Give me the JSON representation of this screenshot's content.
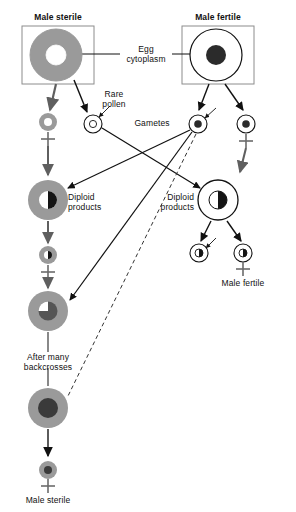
{
  "figure": {
    "title_visible": false,
    "background": "#ffffff",
    "colors": {
      "cytoplasm_sterile": "#9a9a9a",
      "cytoplasm_fertile": "#ffffff",
      "nucleus_dark": "#2b2b2b",
      "nucleus_gray": "#6d6d6d",
      "line": "#111111",
      "box_border": "#8c8c8c",
      "arrow_gray": "#6b6b6b"
    }
  },
  "labels": {
    "male_sterile_top": "Male sterile",
    "male_fertile_top": "Male fertile",
    "egg_cytoplasm": "Egg\ncytoplasm",
    "rare_pollen": "Rare\npollen",
    "gametes": "Gametes",
    "diploid_products_left": "Diploid\nproducts",
    "diploid_products_right": "Diploid\nproducts",
    "male_fertile_bottom": "Male fertile",
    "after_many_backcrosses": "After many\nbackcrosses",
    "male_sterile_bottom": "Male sterile",
    "plus_sign": "+"
  },
  "cells": [
    {
      "name": "male-sterile-parent",
      "role": "parent cell, male sterile, gray (sterile) cytoplasm, white nucleus",
      "cx": 56,
      "cy": 55,
      "r": 26,
      "cytoplasm": "#9a9a9a",
      "nucleus": "#ffffff",
      "nucleus_r": 10,
      "nucleus_style": "solid"
    },
    {
      "name": "male-fertile-parent",
      "role": "parent cell, male fertile, white (normal) cytoplasm, dark nucleus",
      "cx": 216,
      "cy": 55,
      "r": 26,
      "cytoplasm": "#ffffff",
      "nucleus": "#2b2b2b",
      "nucleus_r": 10,
      "nucleus_style": "solid"
    },
    {
      "name": "gamete-sterile-egg",
      "role": "egg gamete from male sterile parent",
      "cx": 48,
      "cy": 122,
      "r": 9,
      "cytoplasm": "#9a9a9a",
      "nucleus": "#ffffff",
      "nucleus_r": 4,
      "nucleus_style": "solid"
    },
    {
      "name": "gamete-rare-pollen",
      "role": "rare pollen from male sterile parent",
      "cx": 93,
      "cy": 124,
      "r": 9,
      "cytoplasm": "#ffffff",
      "nucleus": "#ffffff",
      "nucleus_r": 4,
      "nucleus_style": "outline"
    },
    {
      "name": "gamete-fertile-pollen",
      "role": "pollen gamete from male fertile parent",
      "cx": 198,
      "cy": 124,
      "r": 9,
      "cytoplasm": "#ffffff",
      "nucleus": "#2b2b2b",
      "nucleus_r": 4,
      "nucleus_style": "solid"
    },
    {
      "name": "gamete-fertile-egg",
      "role": "egg gamete from male fertile parent",
      "cx": 246,
      "cy": 124,
      "r": 9,
      "cytoplasm": "#ffffff",
      "nucleus": "#2b2b2b",
      "nucleus_r": 4,
      "nucleus_style": "solid"
    },
    {
      "name": "diploid-left",
      "role": "diploid product, sterile cytoplasm, hybrid nucleus",
      "cx": 48,
      "cy": 200,
      "r": 20,
      "cytoplasm": "#9a9a9a",
      "nucleus": "split",
      "nucleus_r": 9,
      "nucleus_style": "split"
    },
    {
      "name": "diploid-right",
      "role": "diploid product, normal cytoplasm, hybrid nucleus",
      "cx": 218,
      "cy": 200,
      "r": 20,
      "cytoplasm": "#ffffff",
      "nucleus": "split",
      "nucleus_r": 9,
      "nucleus_style": "split"
    },
    {
      "name": "gamete-backcross-1",
      "role": "gamete from left diploid product, sterile cytoplasm, hybrid nucleus",
      "cx": 48,
      "cy": 255,
      "r": 9,
      "cytoplasm": "#9a9a9a",
      "nucleus": "split",
      "nucleus_r": 4,
      "nucleus_style": "split"
    },
    {
      "name": "backcross-cell",
      "role": "backcross progeny cell, sterile cytoplasm, mostly recurrent nucleus",
      "cx": 48,
      "cy": 311,
      "r": 20,
      "cytoplasm": "#9a9a9a",
      "nucleus": "#555555",
      "nucleus_r": 9,
      "nucleus_style": "notch"
    },
    {
      "name": "male-sterile-line-cell",
      "role": "resulting male sterile line cell after many backcrosses",
      "cx": 48,
      "cy": 408,
      "r": 20,
      "cytoplasm": "#9a9a9a",
      "nucleus": "#3a3a3a",
      "nucleus_r": 9,
      "nucleus_style": "solid"
    },
    {
      "name": "male-sterile-final-gamete",
      "role": "final male sterile gamete",
      "cx": 48,
      "cy": 470,
      "r": 9,
      "cytoplasm": "#9a9a9a",
      "nucleus": "#3a3a3a",
      "nucleus_r": 4,
      "nucleus_style": "solid"
    },
    {
      "name": "gamete-fertile-out-left",
      "role": "gamete from right diploid product",
      "cx": 199,
      "cy": 253,
      "r": 9,
      "cytoplasm": "#ffffff",
      "nucleus": "split",
      "nucleus_r": 4,
      "nucleus_style": "split"
    },
    {
      "name": "gamete-fertile-out-right",
      "role": "gamete from right diploid product, male fertile",
      "cx": 243,
      "cy": 253,
      "r": 9,
      "cytoplasm": "#ffffff",
      "nucleus": "split",
      "nucleus_r": 4,
      "nucleus_style": "split"
    }
  ],
  "boxes": [
    {
      "name": "male-sterile-box",
      "x": 22,
      "y": 26,
      "w": 72,
      "h": 58
    },
    {
      "name": "male-fertile-box",
      "x": 182,
      "y": 26,
      "w": 72,
      "h": 58
    }
  ]
}
